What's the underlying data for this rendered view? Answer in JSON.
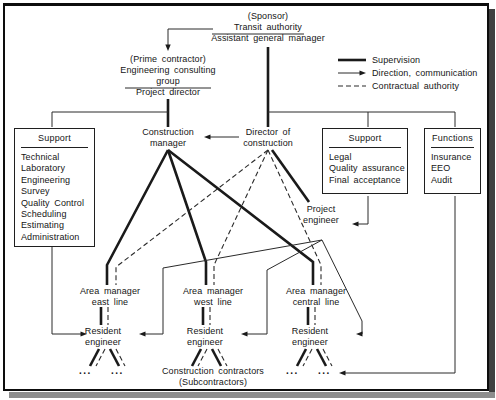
{
  "legend": {
    "items": [
      {
        "label": "Supervision",
        "style": "thick-line"
      },
      {
        "label": "Direction, communication",
        "style": "thin-arrow"
      },
      {
        "label": "Contractual authority",
        "style": "dashed-line"
      }
    ]
  },
  "nodes": {
    "sponsor": {
      "tag": "(Sponsor)",
      "name": "Transit authority",
      "role": "Assistant general manager"
    },
    "prime_contractor": {
      "tag": "(Prime contractor)",
      "name_line1": "Engineering consulting",
      "name_line2": "group",
      "role": "Project director"
    },
    "construction_manager": {
      "line1": "Construction",
      "line2": "manager"
    },
    "director_of_construction": {
      "line1": "Director of",
      "line2": "construction"
    },
    "project_engineer": {
      "line1": "Project",
      "line2": "engineer"
    },
    "area_managers": [
      {
        "line1": "Area manager",
        "line2": "east line"
      },
      {
        "line1": "Area manager",
        "line2": "west line"
      },
      {
        "line1": "Area manager",
        "line2": "central line"
      }
    ],
    "resident_engineer": {
      "line1": "Resident",
      "line2": "engineer"
    },
    "contractors": {
      "line1": "Construction contractors",
      "line2": "(Subcontractors)"
    },
    "ellipsis": "..."
  },
  "boxes": {
    "support_left": {
      "title": "Support",
      "items": [
        "Technical",
        "Laboratory",
        "Engineering",
        "Survey",
        "Quality Control",
        "Scheduling",
        "Estimating",
        "Administration"
      ]
    },
    "support_right": {
      "title": "Support",
      "items": [
        "Legal",
        "Quality assurance",
        "Final acceptance"
      ]
    },
    "functions": {
      "title": "Functions",
      "items": [
        "Insurance",
        "EEO",
        "Audit"
      ]
    }
  },
  "colors": {
    "ink": "#1a1a1a",
    "background": "#ffffff",
    "frame": "#0d0d0d",
    "shadow_right": "#3f3f3f",
    "shadow_bottom": "#8d8d8d"
  }
}
